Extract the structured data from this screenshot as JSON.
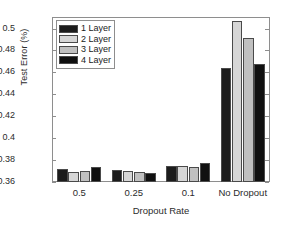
{
  "chart_data": {
    "type": "bar",
    "title": "",
    "xlabel": "Dropout Rate",
    "ylabel": "Test Error (%)",
    "categories": [
      "0.5",
      "0.25",
      "0.1",
      "No Dropout"
    ],
    "ylim": [
      0.36,
      0.5105
    ],
    "yticks": [
      "0.36",
      "0.38",
      "0.4",
      "0.42",
      "0.44",
      "0.46",
      "0.48",
      "0.5"
    ],
    "ytick_values": [
      0.36,
      0.38,
      0.4,
      0.42,
      0.44,
      0.46,
      0.48,
      0.5
    ],
    "grid": false,
    "legend_position": "upper-left",
    "series": [
      {
        "name": "1 Layer",
        "color": "#1c1c1c",
        "values": [
          0.372,
          0.371,
          0.3745,
          0.4636
        ]
      },
      {
        "name": "2 Layer",
        "color": "#d6d6d6",
        "values": [
          0.369,
          0.37,
          0.3748,
          0.5072
        ]
      },
      {
        "name": "3 Layer",
        "color": "#c0c0c0",
        "values": [
          0.37,
          0.3688,
          0.3734,
          0.4912
        ]
      },
      {
        "name": "4 Layer",
        "color": "#101010",
        "values": [
          0.374,
          0.3682,
          0.3772,
          0.4676
        ]
      }
    ]
  },
  "legend": {
    "items": [
      {
        "label": "1 Layer"
      },
      {
        "label": "2 Layer"
      },
      {
        "label": "3 Layer"
      },
      {
        "label": "4 Layer"
      }
    ]
  }
}
